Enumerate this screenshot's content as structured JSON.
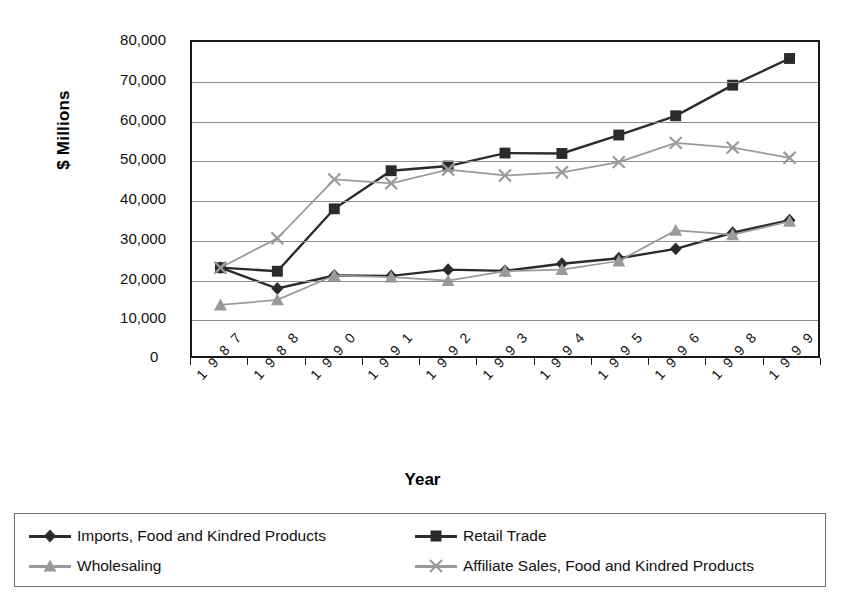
{
  "page": {
    "number": "102",
    "cropped_title": "AGRICULTURE IN THE WORLD ECONOMY"
  },
  "chart_data": {
    "type": "line",
    "title": "",
    "xlabel": "Year",
    "ylabel": "$ Millions",
    "ylim": [
      0,
      80000
    ],
    "ytick_labels": [
      "80,000",
      "70,000",
      "60,000",
      "50,000",
      "40,000",
      "30,000",
      "20,000",
      "10,000"
    ],
    "yticks": [
      80000,
      70000,
      60000,
      50000,
      40000,
      30000,
      20000,
      10000
    ],
    "y_zero_label": "0",
    "grid": true,
    "legend_position": "bottom",
    "categories": [
      "1987",
      "1988",
      "1990",
      "1991",
      "1992",
      "1993",
      "1994",
      "1995",
      "1996",
      "1998",
      "1999"
    ],
    "series": [
      {
        "name": "Imports, Food and Kindred Products",
        "marker": "diamond",
        "color": "#2b2b2b",
        "values": [
          22500,
          17200,
          20500,
          20400,
          22000,
          21700,
          23500,
          24900,
          27300,
          31400,
          34600
        ]
      },
      {
        "name": "Retail Trade",
        "marker": "square",
        "color": "#2b2b2b",
        "values": [
          22500,
          21600,
          37500,
          47200,
          48400,
          51700,
          51600,
          56300,
          61200,
          69000,
          75800
        ]
      },
      {
        "name": "Wholesaling",
        "marker": "triangle",
        "color": "#9a9a9a",
        "values": [
          13000,
          14300,
          20500,
          20100,
          19200,
          21600,
          22000,
          24200,
          32000,
          30900,
          34300
        ]
      },
      {
        "name": "Affiliate Sales, Food and Kindred Products",
        "marker": "cross",
        "color": "#9a9a9a",
        "values": [
          22500,
          30000,
          45000,
          44000,
          47500,
          46000,
          46800,
          49400,
          54300,
          53100,
          50500
        ]
      }
    ]
  },
  "legend": {
    "items": [
      {
        "label": "Imports, Food and Kindred Products",
        "marker": "diamond",
        "color": "#2b2b2b"
      },
      {
        "label": "Retail Trade",
        "marker": "square",
        "color": "#2b2b2b"
      },
      {
        "label": "Wholesaling",
        "marker": "triangle",
        "color": "#9a9a9a"
      },
      {
        "label": "Affiliate Sales, Food and Kindred Products",
        "marker": "cross",
        "color": "#9a9a9a"
      }
    ]
  }
}
